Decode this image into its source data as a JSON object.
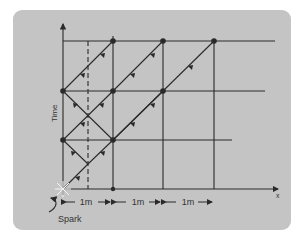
{
  "figure": {
    "axis_labels": {
      "y": "Time",
      "x": "x"
    },
    "spacing_labels": [
      "1m",
      "1m",
      "1m"
    ],
    "annotation": "Spark",
    "colors": {
      "panel": "#c4c4c4",
      "ink": "#2a2a2a",
      "background": "#ffffff"
    }
  }
}
